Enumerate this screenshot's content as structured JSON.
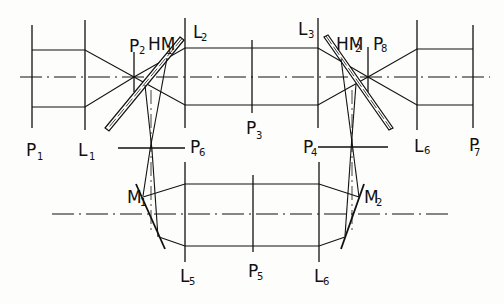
{
  "diagram": {
    "type": "optical ray diagram",
    "labels": {
      "P1": "P",
      "P1_sub": "1",
      "L1": "L",
      "L1_sub": "1",
      "P2": "P",
      "P2_sub": "2",
      "HM1": "HM",
      "HM1_sub": "1",
      "L2": "L",
      "L2_sub": "2",
      "P3": "P",
      "P3_sub": "3",
      "L3": "L",
      "L3_sub": "3",
      "HM2": "HM",
      "HM2_sub": "2",
      "P8": "P",
      "P8_sub": "8",
      "L6_top": "L",
      "L6_top_sub": "6",
      "P7": "P",
      "P7_sub": "7",
      "P6": "P",
      "P6_sub": "6",
      "P4": "P",
      "P4_sub": "4",
      "M1": "M",
      "M1_sub": "1",
      "M2": "M",
      "M2_sub": "2",
      "L5": "L",
      "L5_sub": "5",
      "P5": "P",
      "P5_sub": "5",
      "L6_bottom": "L",
      "L6_bottom_sub": "6"
    },
    "components": [
      {
        "id": "P1",
        "kind": "plane"
      },
      {
        "id": "L1",
        "kind": "lens"
      },
      {
        "id": "P2",
        "kind": "plane"
      },
      {
        "id": "HM1",
        "kind": "half-mirror"
      },
      {
        "id": "L2",
        "kind": "lens"
      },
      {
        "id": "P3",
        "kind": "plane"
      },
      {
        "id": "L3",
        "kind": "lens"
      },
      {
        "id": "HM2",
        "kind": "half-mirror"
      },
      {
        "id": "P8",
        "kind": "plane"
      },
      {
        "id": "L6",
        "kind": "lens"
      },
      {
        "id": "P7",
        "kind": "plane"
      },
      {
        "id": "P6",
        "kind": "plane"
      },
      {
        "id": "P4",
        "kind": "plane"
      },
      {
        "id": "M1",
        "kind": "mirror"
      },
      {
        "id": "M2",
        "kind": "mirror"
      },
      {
        "id": "L5",
        "kind": "lens"
      },
      {
        "id": "P5",
        "kind": "plane"
      },
      {
        "id": "L6",
        "kind": "lens"
      }
    ]
  }
}
